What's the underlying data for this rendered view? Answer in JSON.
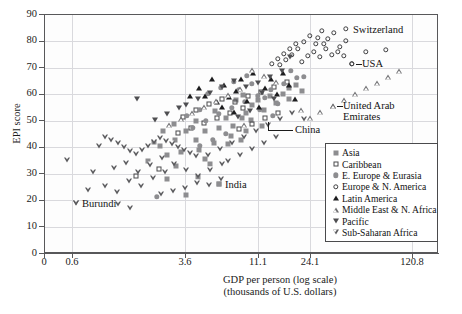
{
  "chart_data": {
    "type": "scatter",
    "title": "",
    "xlabel": "GDP per person (log scale) (thousands of U.S. dollars)",
    "xlabel_line1": "GDP per person (log scale)",
    "xlabel_line2": "(thousands of U.S. dollars)",
    "ylabel": "EPI score",
    "x_scale": "log",
    "xticks": [
      "0",
      "0.6",
      "3.6",
      "11.1",
      "24.1",
      "120.8"
    ],
    "xtick_px": [
      44,
      72,
      185,
      258,
      310,
      412
    ],
    "yticks": [
      "0",
      "10",
      "20",
      "30",
      "40",
      "50",
      "60",
      "70",
      "80",
      "90"
    ],
    "ylim": [
      0,
      90
    ],
    "grid": "both",
    "legend_position": "bottom-right",
    "legend": [
      {
        "label": "Asia",
        "marker": "filled-square",
        "color": "#8d8d90"
      },
      {
        "label": "Caribbean",
        "marker": "open-square",
        "color": "#4a4a4c"
      },
      {
        "label": "E. Europe & Eurasia",
        "marker": "filled-circle",
        "color": "#8d8d90"
      },
      {
        "label": "Europe & N. America",
        "marker": "open-circle",
        "color": "#3f3f41"
      },
      {
        "label": "Latin America",
        "marker": "filled-triangle-up",
        "color": "#1d1d1f"
      },
      {
        "label": "Middle East & N. Africa",
        "marker": "open-triangle-up",
        "color": "#6d6d70"
      },
      {
        "label": "Pacific",
        "marker": "filled-triangle-down",
        "color": "#4e4e51"
      },
      {
        "label": "Sub-Saharan Africa",
        "marker": "open-triangle-down",
        "color": "#5b5b5e"
      }
    ],
    "annotations": [
      {
        "text": "Switzerland",
        "marker": "open-circle",
        "x_px": 346,
        "y_px": 29
      },
      {
        "text": "USA",
        "marker": "open-circle",
        "x_px": 352,
        "y_px": 64
      },
      {
        "text": "United Arab Emirates",
        "marker": "open-triangle-up",
        "x_px": 333,
        "y_px": 106
      },
      {
        "text": "China",
        "marker": "leader-line",
        "x_px": 281,
        "y_px": 121
      },
      {
        "text": "India",
        "marker": "filled-square",
        "x_px": 219,
        "y_px": 184
      },
      {
        "text": "Burundi",
        "marker": "open-triangle-down",
        "x_px": 76,
        "y_px": 203
      }
    ],
    "series": [
      {
        "name": "Asia",
        "marker": "filled-square",
        "points_px": [
          [
            219,
            184
          ],
          [
            186,
            195
          ],
          [
            167,
            179
          ],
          [
            198,
            177
          ],
          [
            181,
            152
          ],
          [
            167,
            155
          ],
          [
            148,
            161
          ],
          [
            160,
            146
          ],
          [
            175,
            140
          ],
          [
            196,
            140
          ],
          [
            205,
            131
          ],
          [
            219,
            128
          ],
          [
            233,
            126
          ],
          [
            242,
            118
          ],
          [
            246,
            113
          ],
          [
            215,
            111
          ],
          [
            196,
            121
          ],
          [
            186,
            131
          ],
          [
            176,
            166
          ],
          [
            205,
            159
          ],
          [
            228,
            144
          ],
          [
            252,
            105
          ],
          [
            258,
            100
          ],
          [
            264,
            110
          ],
          [
            270,
            96
          ],
          [
            276,
            103
          ],
          [
            283,
            94
          ],
          [
            289,
            99
          ],
          [
            246,
            131
          ],
          [
            231,
            136
          ],
          [
            214,
            143
          ],
          [
            199,
            150
          ],
          [
            174,
            124
          ],
          [
            163,
            131
          ],
          [
            154,
            142
          ],
          [
            289,
            88
          ],
          [
            296,
            85
          ],
          [
            302,
            91
          ],
          [
            236,
            100
          ],
          [
            243,
            95
          ],
          [
            251,
            120
          ],
          [
            262,
            126
          ],
          [
            210,
            164
          ],
          [
            226,
            118
          ],
          [
            241,
            140
          ]
        ]
      },
      {
        "name": "Caribbean",
        "marker": "open-square",
        "points_px": [
          [
            136,
            176
          ],
          [
            159,
            169
          ],
          [
            183,
            117
          ],
          [
            196,
            110
          ],
          [
            209,
            104
          ],
          [
            222,
            99
          ],
          [
            235,
            102
          ],
          [
            248,
            96
          ],
          [
            261,
            92
          ],
          [
            274,
            87
          ],
          [
            287,
            82
          ],
          [
            243,
            108
          ],
          [
            230,
            113
          ],
          [
            217,
            118
          ],
          [
            204,
            123
          ],
          [
            191,
            128
          ],
          [
            178,
            133
          ],
          [
            265,
            118
          ],
          [
            278,
            113
          ],
          [
            252,
            124
          ],
          [
            239,
            129
          ]
        ]
      },
      {
        "name": "E. Europe & Eurasia",
        "marker": "filled-circle",
        "points_px": [
          [
            157,
            197
          ],
          [
            193,
            128
          ],
          [
            206,
            121
          ],
          [
            219,
            114
          ],
          [
            232,
            108
          ],
          [
            245,
            102
          ],
          [
            258,
            96
          ],
          [
            271,
            90
          ],
          [
            284,
            84
          ],
          [
            297,
            78
          ],
          [
            226,
            134
          ],
          [
            213,
            140
          ],
          [
            200,
            146
          ],
          [
            239,
            90
          ],
          [
            252,
            84
          ],
          [
            265,
            98
          ],
          [
            278,
            104
          ],
          [
            291,
            71
          ],
          [
            304,
            77
          ],
          [
            200,
            110
          ],
          [
            187,
            116
          ],
          [
            247,
            76
          ],
          [
            234,
            82
          ],
          [
            221,
            88
          ],
          [
            208,
            94
          ],
          [
            260,
            110
          ],
          [
            273,
            116
          ]
        ]
      },
      {
        "name": "Europe & N. America",
        "marker": "open-circle",
        "points_px": [
          [
            304,
            42
          ],
          [
            310,
            36
          ],
          [
            316,
            44
          ],
          [
            322,
            31
          ],
          [
            328,
            39
          ],
          [
            334,
            33
          ],
          [
            340,
            47
          ],
          [
            346,
            41
          ],
          [
            352,
            64
          ],
          [
            366,
            52
          ],
          [
            386,
            50
          ],
          [
            298,
            49
          ],
          [
            292,
            55
          ],
          [
            286,
            60
          ],
          [
            280,
            65
          ],
          [
            314,
            52
          ],
          [
            320,
            57
          ],
          [
            326,
            49
          ],
          [
            332,
            55
          ],
          [
            338,
            52
          ],
          [
            308,
            56
          ],
          [
            302,
            62
          ],
          [
            344,
            56
          ],
          [
            296,
            44
          ],
          [
            290,
            49
          ],
          [
            284,
            54
          ],
          [
            278,
            59
          ],
          [
            272,
            64
          ],
          [
            324,
            44
          ],
          [
            318,
            38
          ]
        ]
      },
      {
        "name": "Latin America",
        "marker": "filled-triangle-up",
        "points_px": [
          [
            212,
            79
          ],
          [
            224,
            85
          ],
          [
            236,
            91
          ],
          [
            205,
            96
          ],
          [
            217,
            102
          ],
          [
            229,
            97
          ],
          [
            241,
            79
          ],
          [
            253,
            73
          ],
          [
            265,
            88
          ],
          [
            277,
            94
          ],
          [
            289,
            85
          ],
          [
            199,
            88
          ],
          [
            190,
            96
          ],
          [
            247,
            101
          ],
          [
            259,
            107
          ],
          [
            271,
            79
          ],
          [
            283,
            73
          ],
          [
            295,
            99
          ],
          [
            234,
            112
          ],
          [
            222,
            107
          ]
        ]
      },
      {
        "name": "Middle East & N. Africa",
        "marker": "open-triangle-up",
        "points_px": [
          [
            333,
            106
          ],
          [
            344,
            100
          ],
          [
            355,
            94
          ],
          [
            366,
            88
          ],
          [
            377,
            83
          ],
          [
            388,
            77
          ],
          [
            399,
            71
          ],
          [
            320,
            112
          ],
          [
            310,
            118
          ],
          [
            276,
            82
          ],
          [
            264,
            76
          ],
          [
            252,
            70
          ],
          [
            240,
            89
          ],
          [
            228,
            95
          ],
          [
            216,
            101
          ],
          [
            204,
            107
          ],
          [
            192,
            113
          ],
          [
            301,
            110
          ],
          [
            181,
            119
          ],
          [
            169,
            125
          ],
          [
            244,
            125
          ]
        ]
      },
      {
        "name": "Pacific",
        "marker": "filled-triangle-down",
        "points_px": [
          [
            137,
            99
          ],
          [
            290,
            57
          ],
          [
            262,
            93
          ],
          [
            274,
            99
          ],
          [
            246,
            87
          ],
          [
            234,
            81
          ],
          [
            222,
            87
          ],
          [
            210,
            93
          ],
          [
            198,
            99
          ],
          [
            186,
            105
          ],
          [
            258,
            83
          ],
          [
            270,
            77
          ],
          [
            282,
            71
          ],
          [
            250,
            111
          ],
          [
            238,
            117
          ],
          [
            155,
            120
          ],
          [
            167,
            114
          ],
          [
            179,
            108
          ]
        ]
      },
      {
        "name": "Sub-Saharan Africa",
        "marker": "open-triangle-down",
        "points_px": [
          [
            76,
            203
          ],
          [
            67,
            160
          ],
          [
            88,
            190
          ],
          [
            99,
            146
          ],
          [
            105,
            137
          ],
          [
            111,
            140
          ],
          [
            118,
            143
          ],
          [
            124,
            147
          ],
          [
            130,
            151
          ],
          [
            136,
            154
          ],
          [
            142,
            150
          ],
          [
            148,
            146
          ],
          [
            154,
            142
          ],
          [
            160,
            138
          ],
          [
            166,
            141
          ],
          [
            172,
            144
          ],
          [
            178,
            147
          ],
          [
            184,
            150
          ],
          [
            190,
            153
          ],
          [
            196,
            156
          ],
          [
            93,
            172
          ],
          [
            114,
            168
          ],
          [
            126,
            163
          ],
          [
            138,
            172
          ],
          [
            150,
            165
          ],
          [
            162,
            158
          ],
          [
            174,
            164
          ],
          [
            186,
            170
          ],
          [
            198,
            176
          ],
          [
            210,
            170
          ],
          [
            222,
            164
          ],
          [
            129,
            181
          ],
          [
            141,
            186
          ],
          [
            153,
            178
          ],
          [
            165,
            172
          ],
          [
            117,
            192
          ],
          [
            105,
            186
          ],
          [
            208,
            155
          ],
          [
            220,
            149
          ],
          [
            232,
            143
          ],
          [
            244,
            137
          ],
          [
            256,
            131
          ],
          [
            268,
            125
          ],
          [
            280,
            119
          ],
          [
            197,
            183
          ],
          [
            185,
            188
          ],
          [
            173,
            191
          ],
          [
            161,
            194
          ],
          [
            209,
            185
          ],
          [
            221,
            179
          ],
          [
            130,
            208
          ],
          [
            118,
            204
          ],
          [
            292,
            113
          ],
          [
            304,
            119
          ],
          [
            276,
            137
          ],
          [
            264,
            143
          ],
          [
            252,
            149
          ],
          [
            240,
            155
          ],
          [
            228,
            161
          ]
        ]
      }
    ]
  }
}
